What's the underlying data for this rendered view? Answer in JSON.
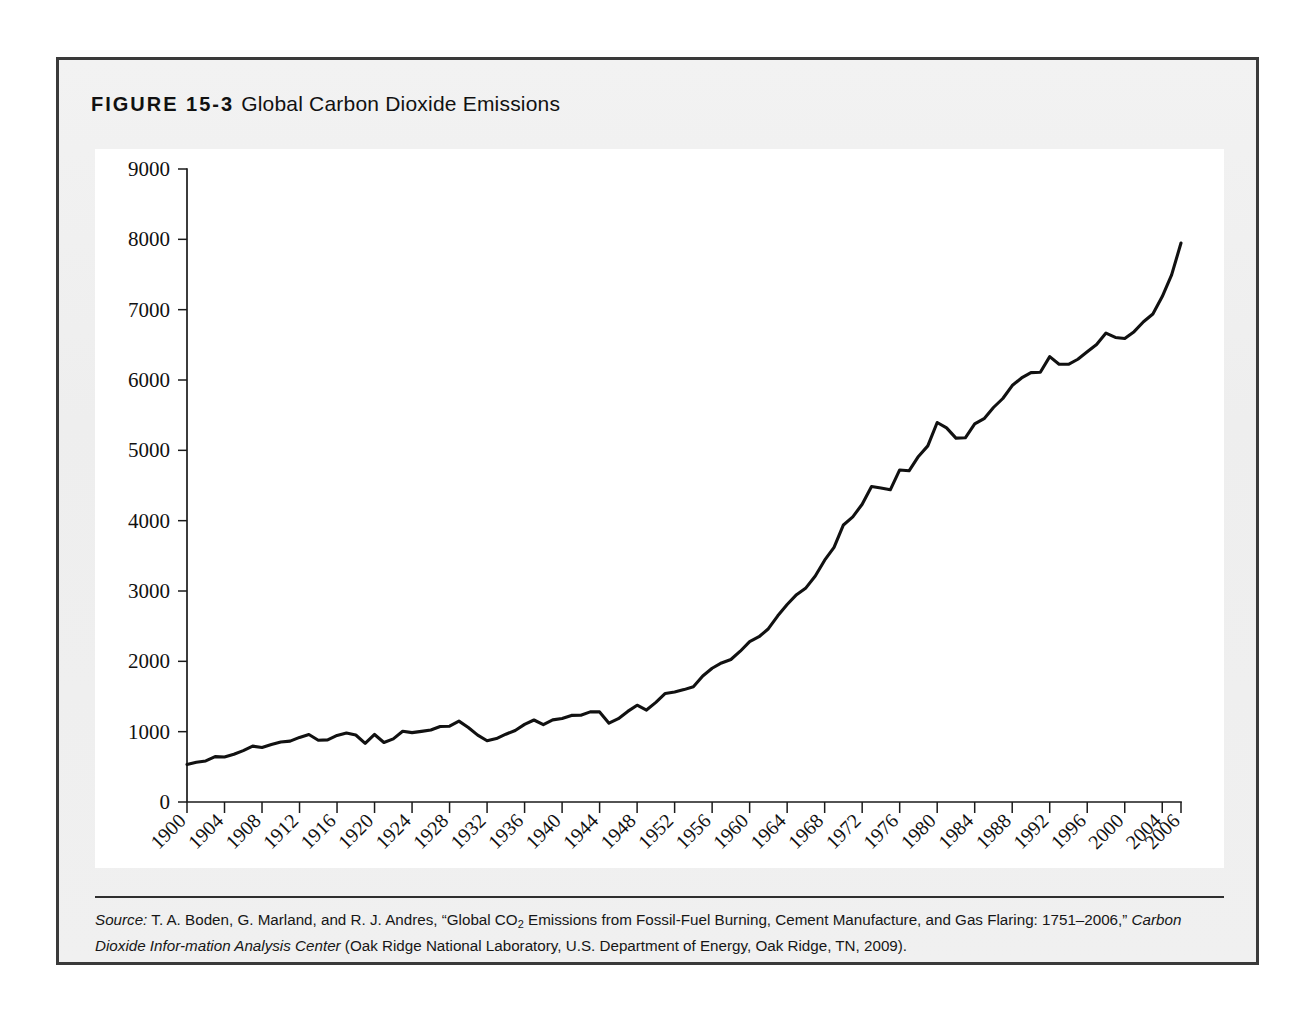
{
  "figure": {
    "label": "FIGURE 15-3",
    "caption": "Global Carbon Dioxide Emissions"
  },
  "source": {
    "lead_word": "Source:",
    "text_part1": " T. A. Boden, G. Marland, and R. J. Andres, “Global CO",
    "subscript": "2",
    "text_part2": " Emissions from Fossil-Fuel Burning, Cement Manufacture, and Gas Flaring: 1751–2006,” ",
    "italic_title": "Carbon Dioxide Infor-mation Analysis Center",
    "text_part3": " (Oak Ridge National Laboratory, U.S. Department of Energy, Oak Ridge, TN, 2009)."
  },
  "colors": {
    "line": "#111111",
    "axis": "#1b1b1b",
    "panel": "#f1f1f1",
    "plot_background": "#ffffff",
    "frame_border": "#3a3a3a"
  },
  "chart_data": {
    "type": "line",
    "title": "Global Carbon Dioxide Emissions",
    "xlabel": "",
    "ylabel": "",
    "grid": false,
    "legend": false,
    "xlim": [
      1900,
      2006
    ],
    "ylim": [
      0,
      9000
    ],
    "y_ticks": [
      0,
      1000,
      2000,
      3000,
      4000,
      5000,
      6000,
      7000,
      8000,
      9000
    ],
    "y_tick_labels": [
      "0",
      "1000",
      "2000",
      "3000",
      "4000",
      "5000",
      "6000",
      "7000",
      "8000",
      "9000"
    ],
    "x_ticks": [
      1900,
      1904,
      1908,
      1912,
      1916,
      1920,
      1924,
      1928,
      1932,
      1936,
      1940,
      1944,
      1948,
      1952,
      1956,
      1960,
      1964,
      1968,
      1972,
      1976,
      1980,
      1984,
      1988,
      1992,
      1996,
      2000,
      2004,
      2006
    ],
    "x_tick_labels": [
      "1900",
      "1904",
      "1908",
      "1912",
      "1916",
      "1920",
      "1924",
      "1928",
      "1932",
      "1936",
      "1940",
      "1944",
      "1948",
      "1952",
      "1956",
      "1960",
      "1964",
      "1968",
      "1972",
      "1976",
      "1980",
      "1984",
      "1988",
      "1992",
      "1996",
      "2000",
      "2004",
      "2006"
    ],
    "x": [
      1900,
      1901,
      1902,
      1903,
      1904,
      1905,
      1906,
      1907,
      1908,
      1909,
      1910,
      1911,
      1912,
      1913,
      1914,
      1915,
      1916,
      1917,
      1918,
      1919,
      1920,
      1921,
      1922,
      1923,
      1924,
      1925,
      1926,
      1927,
      1928,
      1929,
      1930,
      1931,
      1932,
      1933,
      1934,
      1935,
      1936,
      1937,
      1938,
      1939,
      1940,
      1941,
      1942,
      1943,
      1944,
      1945,
      1946,
      1947,
      1948,
      1949,
      1950,
      1951,
      1952,
      1953,
      1954,
      1955,
      1956,
      1957,
      1958,
      1959,
      1960,
      1961,
      1962,
      1963,
      1964,
      1965,
      1966,
      1967,
      1968,
      1969,
      1970,
      1971,
      1972,
      1973,
      1974,
      1975,
      1976,
      1977,
      1978,
      1979,
      1980,
      1981,
      1982,
      1983,
      1984,
      1985,
      1986,
      1987,
      1988,
      1989,
      1990,
      1991,
      1992,
      1993,
      1994,
      1995,
      1996,
      1997,
      1998,
      1999,
      2000,
      2001,
      2002,
      2003,
      2004,
      2005,
      2006
    ],
    "y": [
      534,
      566,
      584,
      645,
      640,
      679,
      730,
      794,
      776,
      818,
      853,
      865,
      918,
      959,
      878,
      884,
      946,
      982,
      953,
      834,
      960,
      846,
      898,
      1006,
      986,
      1004,
      1024,
      1073,
      1078,
      1150,
      1060,
      951,
      871,
      902,
      964,
      1017,
      1103,
      1166,
      1100,
      1168,
      1187,
      1231,
      1234,
      1281,
      1281,
      1120,
      1185,
      1288,
      1376,
      1307,
      1416,
      1543,
      1564,
      1598,
      1640,
      1792,
      1902,
      1977,
      2026,
      2144,
      2281,
      2350,
      2464,
      2647,
      2808,
      2948,
      3044,
      3213,
      3438,
      3620,
      3939,
      4053,
      4234,
      4486,
      4464,
      4439,
      4721,
      4709,
      4913,
      5063,
      5396,
      5319,
      5174,
      5178,
      5375,
      5450,
      5609,
      5737,
      5921,
      6029,
      6105,
      6110,
      6332,
      6224,
      6223,
      6295,
      6401,
      6505,
      6667,
      6605,
      6589,
      6687,
      6828,
      6939,
      7187,
      7494,
      7947,
      8230
    ]
  }
}
